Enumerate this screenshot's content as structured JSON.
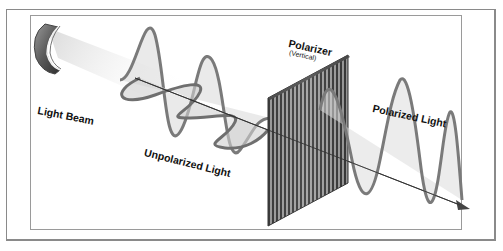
{
  "diagram": {
    "labels": {
      "light_beam": "Light Beam",
      "unpolarized_light": "Unpolarized Light",
      "polarizer": "Polarizer",
      "polarizer_orientation": "(Vertical)",
      "polarized_light": "Polarized Light"
    },
    "components": [
      {
        "name": "light-source",
        "description": "cylindrical lamp emitting a beam"
      },
      {
        "name": "unpolarized-waves",
        "description": "two orthogonal sine waves along the propagation axis"
      },
      {
        "name": "polarizer-grid",
        "description": "vertical slotted filter"
      },
      {
        "name": "polarized-wave",
        "description": "single vertical sine wave after the polarizer"
      },
      {
        "name": "propagation-arrow",
        "description": "arrow showing direction of travel"
      }
    ],
    "colors": {
      "wave_stroke": "#7a7a7a",
      "wave_fill": "#d9d9d9",
      "axis": "#333333",
      "polarizer_dark": "#4a4a4a",
      "polarizer_light": "#bdbdbd",
      "frame": "#8a8a8a"
    }
  }
}
